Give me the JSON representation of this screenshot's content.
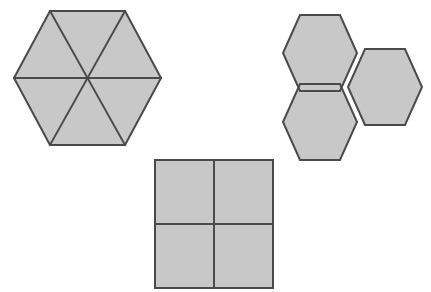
{
  "figure": {
    "background_color": "#ffffff",
    "fill_color": "#c8c8c8",
    "stroke_color": "#4a4a4a",
    "stroke_width": 2,
    "canvas": {
      "width": 431,
      "height": 292
    },
    "shape_count": 3
  },
  "shapes": [
    {
      "id": "divided-hexagon",
      "name": "hexagon-divided-into-six-triangles",
      "type": "hexagon",
      "description": "Large regular hexagon subdivided into six congruent triangles by three main diagonals",
      "parts": 6,
      "part_shape": "triangle",
      "center": {
        "x": 87,
        "y": 78
      },
      "vertices": [
        {
          "x": 50,
          "y": 11
        },
        {
          "x": 125,
          "y": 11
        },
        {
          "x": 161,
          "y": 78
        },
        {
          "x": 125,
          "y": 145
        },
        {
          "x": 50,
          "y": 145
        },
        {
          "x": 14,
          "y": 78
        }
      ],
      "outline_path": "M 50 11 L 125 11 L 161 78 L 125 145 L 50 145 L 14 78 Z",
      "dividers": [
        {
          "name": "horizontal-diagonal",
          "x1": 14,
          "y1": 78,
          "x2": 161,
          "y2": 78
        },
        {
          "name": "diagonal-top-left-to-bottom-right",
          "x1": 50,
          "y1": 11,
          "x2": 125,
          "y2": 145
        },
        {
          "name": "diagonal-top-right-to-bottom-left",
          "x1": 125,
          "y1": 11,
          "x2": 50,
          "y2": 145
        }
      ]
    },
    {
      "id": "hexagon-cluster",
      "name": "three-hexagon-cluster",
      "type": "hexagon-cluster",
      "description": "Three regular hexagons joined edge to edge meeting at a shared vertex",
      "parts": 3,
      "part_shape": "hexagon",
      "hexagons": [
        {
          "name": "cluster-hexagon-top-left",
          "center": {
            "x": 317,
            "y": 53
          },
          "outline_path": "M 300 15 L 340 15 L 357 53 L 340 91 L 300 91 L 283 53 Z"
        },
        {
          "name": "cluster-hexagon-bottom-left",
          "center": {
            "x": 317,
            "y": 122
          },
          "outline_path": "M 300 84 L 340 84 L 357 122 L 340 160 L 300 160 L 283 122 Z"
        },
        {
          "name": "cluster-hexagon-right",
          "center": {
            "x": 382,
            "y": 87
          },
          "outline_path": "M 365 49 L 405 49 L 422 87 L 405 125 L 365 125 L 348 87 Z"
        }
      ]
    },
    {
      "id": "divided-square",
      "name": "square-divided-into-four-quadrants",
      "type": "square",
      "description": "Square subdivided into four equal smaller squares by a vertical and horizontal midline",
      "parts": 4,
      "part_shape": "square",
      "bounds": {
        "x": 155,
        "y": 160,
        "width": 118,
        "height": 128
      },
      "outline_path": "M 155 160 L 273 160 L 273 288 L 155 288 Z",
      "dividers": [
        {
          "name": "vertical-midline",
          "x1": 214,
          "y1": 160,
          "x2": 214,
          "y2": 288
        },
        {
          "name": "horizontal-midline",
          "x1": 155,
          "y1": 224,
          "x2": 273,
          "y2": 224
        }
      ]
    }
  ]
}
